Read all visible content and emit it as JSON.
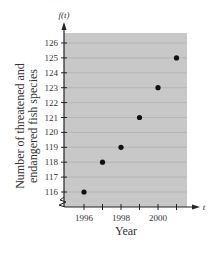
{
  "chart_data": {
    "type": "scatter",
    "title": "",
    "xlabel": "Year",
    "ylabel": "Number of threatened and endangered fish species",
    "x_axis_var": "t",
    "y_axis_var": "f(t)",
    "x": [
      1996,
      1997,
      1998,
      1999,
      2000,
      2001
    ],
    "y": [
      116,
      118,
      119,
      121,
      123,
      125
    ],
    "xlim": [
      1995,
      2001.5
    ],
    "ylim": [
      115,
      126.5
    ],
    "x_ticks": [
      1996,
      1997,
      1998,
      1999,
      2000,
      2001
    ],
    "x_tick_labels": [
      "1996",
      "",
      "1998",
      "",
      "2000",
      ""
    ],
    "y_ticks": [
      116,
      117,
      118,
      119,
      120,
      121,
      122,
      123,
      124,
      125,
      126
    ],
    "y_tick_labels": [
      "116",
      "117",
      "118",
      "119",
      "120",
      "121",
      "122",
      "123",
      "124",
      "125",
      "126"
    ],
    "grid": true,
    "axis_break": true,
    "colors": {
      "plot_bg": "#c8c8c8",
      "grid": "#b0b0b0",
      "point": "#111111",
      "axis": "#222222"
    }
  }
}
